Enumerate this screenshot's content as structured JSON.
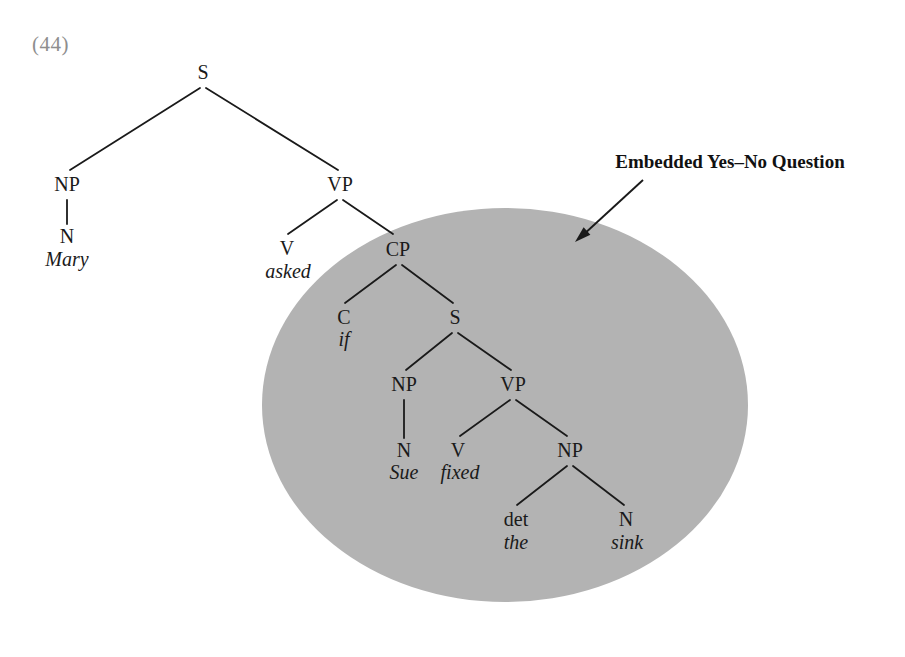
{
  "example": {
    "number": "(44)"
  },
  "annotation": {
    "label": "Embedded Yes–No Question",
    "arrow_icon": "arrow-down-left-icon"
  },
  "highlight": {
    "shape": "ellipse",
    "color": "#b3b3b3",
    "cx": 505,
    "cy": 405,
    "rx": 243,
    "ry": 197
  },
  "colors": {
    "ink": "#1a1a1a",
    "example_number": "#8e8e8e",
    "shade": "#b3b3b3",
    "background": "#ffffff"
  },
  "tree": {
    "nodes": [
      {
        "id": "S-root",
        "label": "S",
        "x": 203,
        "y": 72,
        "kind": "category"
      },
      {
        "id": "NP-subj",
        "label": "NP",
        "x": 67,
        "y": 184,
        "kind": "category"
      },
      {
        "id": "VP-main",
        "label": "VP",
        "x": 340,
        "y": 184,
        "kind": "category"
      },
      {
        "id": "N-mary",
        "label": "N",
        "x": 67,
        "y": 236,
        "kind": "category"
      },
      {
        "id": "V-asked",
        "label": "V",
        "x": 287,
        "y": 248,
        "kind": "category"
      },
      {
        "id": "CP",
        "label": "CP",
        "x": 398,
        "y": 249,
        "kind": "category"
      },
      {
        "id": "C-if",
        "label": "C",
        "x": 344,
        "y": 317,
        "kind": "category"
      },
      {
        "id": "S-embedded",
        "label": "S",
        "x": 455,
        "y": 317,
        "kind": "category"
      },
      {
        "id": "NP-sue",
        "label": "NP",
        "x": 404,
        "y": 384,
        "kind": "category"
      },
      {
        "id": "VP-embedded",
        "label": "VP",
        "x": 513,
        "y": 384,
        "kind": "category"
      },
      {
        "id": "N-sue",
        "label": "N",
        "x": 404,
        "y": 450,
        "kind": "category"
      },
      {
        "id": "V-fixed",
        "label": "V",
        "x": 458,
        "y": 450,
        "kind": "category"
      },
      {
        "id": "NP-obj",
        "label": "NP",
        "x": 570,
        "y": 450,
        "kind": "category"
      },
      {
        "id": "det-the",
        "label": "det",
        "x": 516,
        "y": 519,
        "kind": "category"
      },
      {
        "id": "N-sink",
        "label": "N",
        "x": 626,
        "y": 519,
        "kind": "category"
      }
    ],
    "terminals": [
      {
        "id": "word-mary",
        "label": "Mary",
        "x": 67,
        "y": 259
      },
      {
        "id": "word-asked",
        "label": "asked",
        "x": 288,
        "y": 271
      },
      {
        "id": "word-if",
        "label": "if",
        "x": 344,
        "y": 339
      },
      {
        "id": "word-sue",
        "label": "Sue",
        "x": 404,
        "y": 472
      },
      {
        "id": "word-fixed",
        "label": "fixed",
        "x": 460,
        "y": 472
      },
      {
        "id": "word-the",
        "label": "the",
        "x": 516,
        "y": 542
      },
      {
        "id": "word-sink",
        "label": "sink",
        "x": 627,
        "y": 542
      }
    ],
    "edges": [
      {
        "from": "S-root",
        "to": "NP-subj",
        "x1": 200,
        "y1": 88,
        "x2": 70,
        "y2": 170
      },
      {
        "from": "S-root",
        "to": "VP-main",
        "x1": 206,
        "y1": 88,
        "x2": 338,
        "y2": 170
      },
      {
        "from": "NP-subj",
        "to": "N-mary",
        "x1": 67,
        "y1": 200,
        "x2": 67,
        "y2": 224
      },
      {
        "from": "VP-main",
        "to": "V-asked",
        "x1": 337,
        "y1": 200,
        "x2": 288,
        "y2": 234
      },
      {
        "from": "VP-main",
        "to": "CP",
        "x1": 343,
        "y1": 200,
        "x2": 393,
        "y2": 234
      },
      {
        "from": "CP",
        "to": "C-if",
        "x1": 396,
        "y1": 265,
        "x2": 345,
        "y2": 303
      },
      {
        "from": "CP",
        "to": "S-embedded",
        "x1": 402,
        "y1": 265,
        "x2": 453,
        "y2": 303
      },
      {
        "from": "S-embedded",
        "to": "NP-sue",
        "x1": 452,
        "y1": 333,
        "x2": 406,
        "y2": 370
      },
      {
        "from": "S-embedded",
        "to": "VP-embedded",
        "x1": 458,
        "y1": 333,
        "x2": 511,
        "y2": 370
      },
      {
        "from": "NP-sue",
        "to": "N-sue",
        "x1": 404,
        "y1": 400,
        "x2": 404,
        "y2": 438
      },
      {
        "from": "VP-embedded",
        "to": "V-fixed",
        "x1": 510,
        "y1": 400,
        "x2": 460,
        "y2": 436
      },
      {
        "from": "VP-embedded",
        "to": "NP-obj",
        "x1": 516,
        "y1": 400,
        "x2": 567,
        "y2": 436
      },
      {
        "from": "NP-obj",
        "to": "det-the",
        "x1": 567,
        "y1": 466,
        "x2": 517,
        "y2": 505
      },
      {
        "from": "NP-obj",
        "to": "N-sink",
        "x1": 573,
        "y1": 466,
        "x2": 624,
        "y2": 505
      }
    ],
    "arrow": {
      "x1": 643,
      "y1": 180,
      "x2": 575,
      "y2": 242
    }
  }
}
